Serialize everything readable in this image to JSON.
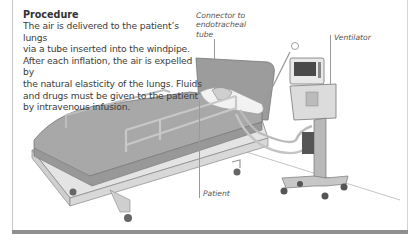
{
  "procedure": {
    "heading": "Procedure",
    "lines": [
      "The air is delivered to the patient’s lungs",
      "via a tube inserted into the windpipe.",
      "After each inflation, the air is expelled by",
      "the natural elasticity of the lungs. Fluids",
      "and drugs must be given to the patient",
      "by intravenous infusion."
    ]
  },
  "labels": {
    "connector": [
      "Connector to",
      "endotracheal",
      "tube"
    ],
    "ventilator": "Ventilator",
    "patient": "Patient"
  },
  "colors": {
    "frame": "#c9c9c9",
    "bottom_bar": "#8f8f8f",
    "text": "#3a3a3a",
    "bed_sheet": "#a9a9a9"
  }
}
